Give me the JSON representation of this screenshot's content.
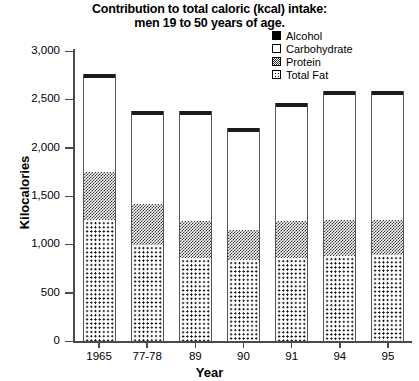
{
  "chart_data": {
    "type": "bar",
    "stacked": true,
    "title": "Contribution to total caloric (kcal) intake: men 19 to 50 years of age.",
    "title_line1": "Contribution to total caloric (kcal) intake:",
    "title_line2": "men 19 to 50 years of age.",
    "xlabel": "Year",
    "ylabel": "Kilocalories",
    "categories": [
      "1965",
      "77-78",
      "89",
      "90",
      "91",
      "94",
      "95"
    ],
    "ylim": [
      0,
      3000
    ],
    "yticks": [
      0,
      500,
      1000,
      1500,
      2000,
      2500,
      3000
    ],
    "ytick_labels": [
      "0",
      "500",
      "1,000",
      "1,500",
      "2,000",
      "2,500",
      "3,000"
    ],
    "grid": false,
    "legend_position": "top-right",
    "series": [
      {
        "name": "Total Fat",
        "values": [
          1250,
          990,
          860,
          840,
          860,
          880,
          890
        ]
      },
      {
        "name": "Protein",
        "values": [
          500,
          430,
          380,
          310,
          380,
          370,
          360
        ]
      },
      {
        "name": "Carbohydrate",
        "values": [
          970,
          920,
          1100,
          1010,
          1180,
          1300,
          1300
        ]
      },
      {
        "name": "Alcohol",
        "values": [
          40,
          40,
          40,
          40,
          40,
          40,
          40
        ]
      }
    ],
    "totals": [
      2760,
      2380,
      2380,
      2200,
      2460,
      2590,
      2590
    ]
  },
  "legend": {
    "items": [
      {
        "label": "Alcohol",
        "swatch": "solid-black-swatch"
      },
      {
        "label": "Carbohydrate",
        "swatch": "empty-white-swatch"
      },
      {
        "label": "Protein",
        "swatch": "dense-check-swatch"
      },
      {
        "label": "Total Fat",
        "swatch": "dotted-swatch"
      }
    ]
  }
}
